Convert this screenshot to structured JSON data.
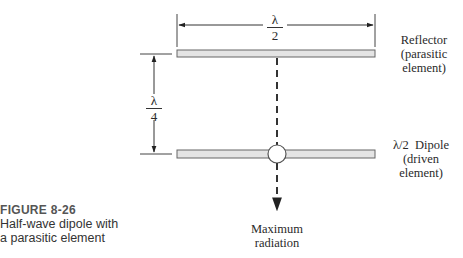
{
  "figure": {
    "number": "FIGURE 8-26",
    "caption_line1": "Half-wave dipole with",
    "caption_line2": "a parasitic element"
  },
  "dimensions": {
    "element_length": {
      "numerator": "λ",
      "denominator": "2"
    },
    "spacing": {
      "numerator": "λ",
      "denominator": "4"
    }
  },
  "labels": {
    "reflector": [
      "Reflector",
      "(parasitic",
      "element)"
    ],
    "dipole": [
      "λ/2  Dipole",
      "(driven",
      "element)"
    ],
    "radiation": [
      "Maximum",
      "radiation"
    ]
  },
  "colors": {
    "element_fill": "#e4e4e4",
    "element_stroke": "#666666",
    "line": "#333333"
  }
}
